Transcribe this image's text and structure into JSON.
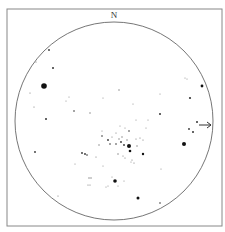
{
  "chart": {
    "type": "star-finder-chart",
    "orientation_label": "N",
    "frame": {
      "x": 7,
      "y": 9,
      "w": 215,
      "h": 217,
      "stroke": "#888888"
    },
    "field_circle": {
      "cx": 114,
      "cy": 121,
      "r": 99,
      "stroke": "#666666"
    },
    "marker_arrow": {
      "x1": 199,
      "y1": 125,
      "x2": 211,
      "y2": 125,
      "color": "#333333"
    },
    "stars": [
      {
        "x": 44,
        "y": 86,
        "r": 2.8
      },
      {
        "x": 184,
        "y": 144,
        "r": 2.0
      },
      {
        "x": 129,
        "y": 146,
        "r": 2.0
      },
      {
        "x": 115,
        "y": 181,
        "r": 1.8
      },
      {
        "x": 138,
        "y": 198,
        "r": 1.5
      },
      {
        "x": 202,
        "y": 86,
        "r": 1.4
      },
      {
        "x": 190,
        "y": 98,
        "r": 1.1
      },
      {
        "x": 130,
        "y": 151,
        "r": 1.3
      },
      {
        "x": 143,
        "y": 154,
        "r": 1.2
      },
      {
        "x": 53,
        "y": 68,
        "r": 1.0
      },
      {
        "x": 46,
        "y": 119,
        "r": 1.0
      },
      {
        "x": 49,
        "y": 50,
        "r": 0.9
      },
      {
        "x": 160,
        "y": 114,
        "r": 1.0
      },
      {
        "x": 197,
        "y": 122,
        "r": 1.0
      },
      {
        "x": 189,
        "y": 129,
        "r": 0.9
      },
      {
        "x": 193,
        "y": 132,
        "r": 1.0
      },
      {
        "x": 35,
        "y": 152,
        "r": 0.9
      },
      {
        "x": 74,
        "y": 111,
        "r": 0.8
      },
      {
        "x": 119,
        "y": 90,
        "r": 0.7
      },
      {
        "x": 90,
        "y": 113,
        "r": 0.7
      },
      {
        "x": 160,
        "y": 203,
        "r": 0.8
      },
      {
        "x": 58,
        "y": 196,
        "r": 0.6
      },
      {
        "x": 34,
        "y": 107,
        "r": 0.6
      },
      {
        "x": 30,
        "y": 93,
        "r": 0.6
      },
      {
        "x": 36,
        "y": 62,
        "r": 0.6
      },
      {
        "x": 103,
        "y": 98,
        "r": 0.5
      },
      {
        "x": 133,
        "y": 104,
        "r": 0.5
      },
      {
        "x": 160,
        "y": 94,
        "r": 0.5
      },
      {
        "x": 66,
        "y": 101,
        "r": 0.5
      },
      {
        "x": 69,
        "y": 97,
        "r": 0.5
      },
      {
        "x": 185,
        "y": 78,
        "r": 0.5
      },
      {
        "x": 187,
        "y": 79,
        "r": 0.5
      },
      {
        "x": 102,
        "y": 136,
        "r": 0.8
      },
      {
        "x": 108,
        "y": 140,
        "r": 0.9
      },
      {
        "x": 110,
        "y": 144,
        "r": 0.8
      },
      {
        "x": 116,
        "y": 144,
        "r": 0.8
      },
      {
        "x": 121,
        "y": 142,
        "r": 0.9
      },
      {
        "x": 124,
        "y": 145,
        "r": 0.9
      },
      {
        "x": 119,
        "y": 139,
        "r": 0.7
      },
      {
        "x": 122,
        "y": 137,
        "r": 0.7
      },
      {
        "x": 127,
        "y": 140,
        "r": 0.7
      },
      {
        "x": 136,
        "y": 139,
        "r": 0.6
      },
      {
        "x": 140,
        "y": 138,
        "r": 0.6
      },
      {
        "x": 143,
        "y": 140,
        "r": 0.6
      },
      {
        "x": 137,
        "y": 146,
        "r": 0.7
      },
      {
        "x": 99,
        "y": 145,
        "r": 0.7
      },
      {
        "x": 129,
        "y": 131,
        "r": 0.8
      },
      {
        "x": 120,
        "y": 126,
        "r": 0.5
      },
      {
        "x": 125,
        "y": 128,
        "r": 0.5
      },
      {
        "x": 136,
        "y": 120,
        "r": 0.5
      },
      {
        "x": 146,
        "y": 128,
        "r": 0.5
      },
      {
        "x": 148,
        "y": 120,
        "r": 0.5
      },
      {
        "x": 102,
        "y": 131,
        "r": 0.5
      },
      {
        "x": 82,
        "y": 153,
        "r": 0.9
      },
      {
        "x": 85,
        "y": 154,
        "r": 0.9
      },
      {
        "x": 87,
        "y": 155,
        "r": 0.8
      },
      {
        "x": 96,
        "y": 157,
        "r": 0.6
      },
      {
        "x": 75,
        "y": 164,
        "r": 0.5
      },
      {
        "x": 118,
        "y": 154,
        "r": 0.7
      },
      {
        "x": 123,
        "y": 156,
        "r": 0.6
      },
      {
        "x": 125,
        "y": 158,
        "r": 0.6
      },
      {
        "x": 132,
        "y": 160,
        "r": 0.6
      },
      {
        "x": 134,
        "y": 163,
        "r": 0.6
      },
      {
        "x": 131,
        "y": 162,
        "r": 0.5
      },
      {
        "x": 103,
        "y": 166,
        "r": 0.5
      },
      {
        "x": 89,
        "y": 178,
        "r": 0.7
      },
      {
        "x": 91,
        "y": 178,
        "r": 0.7
      },
      {
        "x": 88,
        "y": 185,
        "r": 0.6
      },
      {
        "x": 90,
        "y": 185,
        "r": 0.6
      },
      {
        "x": 108,
        "y": 186,
        "r": 0.5
      },
      {
        "x": 118,
        "y": 186,
        "r": 0.5
      },
      {
        "x": 124,
        "y": 181,
        "r": 0.5
      },
      {
        "x": 112,
        "y": 177,
        "r": 0.5
      },
      {
        "x": 106,
        "y": 187,
        "r": 0.5
      },
      {
        "x": 161,
        "y": 169,
        "r": 0.5
      },
      {
        "x": 112,
        "y": 137,
        "r": 0.6
      },
      {
        "x": 116,
        "y": 133,
        "r": 0.6
      }
    ]
  }
}
